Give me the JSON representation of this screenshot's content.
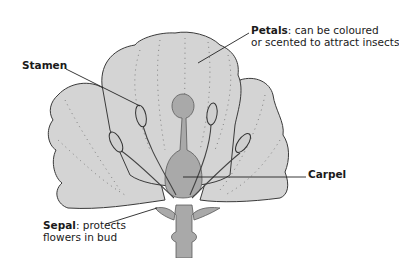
{
  "diagram": {
    "colors": {
      "petal_fill": "#d4d4d4",
      "carpel_fill": "#a9a9a9",
      "outline": "#3a3a3a",
      "leader_line": "#222222"
    },
    "labels": {
      "petals": {
        "term": "Petals",
        "separator": ": ",
        "line1": "can be coloured",
        "line2": "or scented to attract insects"
      },
      "stamen": {
        "term": "Stamen"
      },
      "carpel": {
        "term": "Carpel"
      },
      "sepal": {
        "term": "Sepal",
        "separator": ": ",
        "line1": "protects",
        "line2": "flowers in bud"
      }
    }
  }
}
